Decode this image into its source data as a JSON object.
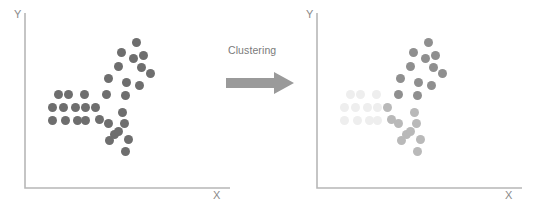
{
  "figure": {
    "transform_label": "Clustering",
    "arrow_icon": "right-block-arrow-icon",
    "arrow_color": "#9a9a9a"
  },
  "panels": [
    {
      "id": "before",
      "name": "unclustered-scatter-plot",
      "x_axis_label": "X",
      "y_axis_label": "Y",
      "axis_color": "#b7b7b7",
      "point_color": "#6e6e6e",
      "point_diameter_px": 9
    },
    {
      "id": "after",
      "name": "clustered-scatter-plot",
      "x_axis_label": "X",
      "y_axis_label": "Y",
      "axis_color": "#b7b7b7",
      "cluster_colors": {
        "cluster_a": "#eeeeee",
        "cluster_b": "#b9b9b9",
        "cluster_c": "#8f8f8f"
      },
      "point_diameter_px": 9
    }
  ],
  "chart_data": {
    "type": "scatter",
    "title": "Clustering",
    "xlabel": "X",
    "ylabel": "Y",
    "grid": false,
    "legend": false,
    "axis_ranges": {
      "xlim": [
        0,
        100
      ],
      "ylim": [
        0,
        100
      ]
    },
    "panel_before": {
      "name": "Before clustering",
      "series": [
        {
          "name": "unlabeled",
          "color": "#6e6e6e",
          "points": [
            [
              58,
              94
            ],
            [
              68,
              94
            ],
            [
              84,
              94
            ],
            [
              52,
              107
            ],
            [
              63,
              107
            ],
            [
              75,
              107
            ],
            [
              85,
              107
            ],
            [
              52,
              120
            ],
            [
              65,
              120
            ],
            [
              77,
              120
            ],
            [
              85,
              120
            ],
            [
              95,
              107
            ],
            [
              99,
              119
            ],
            [
              106,
              94
            ],
            [
              108,
              123
            ],
            [
              114,
              134
            ],
            [
              108,
              78
            ],
            [
              118,
              66
            ],
            [
              121,
              52
            ],
            [
              136,
              42
            ],
            [
              133,
              58
            ],
            [
              141,
              67
            ],
            [
              126,
              82
            ],
            [
              125,
              95
            ],
            [
              139,
              85
            ],
            [
              150,
              73
            ],
            [
              143,
              55
            ],
            [
              122,
              112
            ],
            [
              118,
              131
            ],
            [
              128,
              139
            ],
            [
              124,
              123
            ],
            [
              109,
              140
            ],
            [
              125,
              151
            ]
          ]
        }
      ]
    },
    "panel_after": {
      "name": "After clustering",
      "series": [
        {
          "name": "cluster_a",
          "color": "#eeeeee",
          "points": [
            [
              58,
              94
            ],
            [
              68,
              94
            ],
            [
              84,
              94
            ],
            [
              52,
              107
            ],
            [
              63,
              107
            ],
            [
              75,
              107
            ],
            [
              85,
              107
            ],
            [
              52,
              120
            ],
            [
              65,
              120
            ],
            [
              77,
              120
            ],
            [
              85,
              120
            ]
          ]
        },
        {
          "name": "cluster_b",
          "color": "#b9b9b9",
          "points": [
            [
              95,
              107
            ],
            [
              99,
              119
            ],
            [
              106,
              123
            ],
            [
              114,
              134
            ],
            [
              122,
              112
            ],
            [
              118,
              131
            ],
            [
              128,
              139
            ],
            [
              124,
              123
            ],
            [
              109,
              140
            ],
            [
              125,
              151
            ]
          ]
        },
        {
          "name": "cluster_c",
          "color": "#8f8f8f",
          "points": [
            [
              106,
              94
            ],
            [
              108,
              78
            ],
            [
              118,
              66
            ],
            [
              121,
              52
            ],
            [
              136,
              42
            ],
            [
              133,
              58
            ],
            [
              141,
              67
            ],
            [
              126,
              82
            ],
            [
              125,
              95
            ],
            [
              139,
              85
            ],
            [
              150,
              73
            ],
            [
              143,
              55
            ]
          ]
        }
      ]
    }
  }
}
